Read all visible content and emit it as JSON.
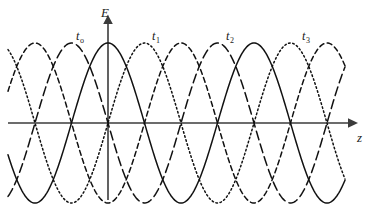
{
  "figure": {
    "axes": {
      "vertical": {
        "name": "E-axis",
        "label": "E",
        "arrow": "up-arrow-icon"
      },
      "horizontal": {
        "name": "z-axis",
        "label": "z",
        "arrow": "right-arrow-icon"
      }
    },
    "curve_labels": [
      {
        "id": "t0",
        "base": "t",
        "sub": "o",
        "line_style": "solid"
      },
      {
        "id": "t1",
        "base": "t",
        "sub": "1",
        "line_style": "dotted"
      },
      {
        "id": "t2",
        "base": "t",
        "sub": "2",
        "line_style": "dashed"
      },
      {
        "id": "t3",
        "base": "t",
        "sub": "3",
        "line_style": "long-dashed"
      }
    ]
  },
  "chart_data": {
    "type": "line",
    "title": "",
    "xlabel": "z",
    "ylabel": "E",
    "grid": false,
    "legend": "inline-curve-labels",
    "axis_origin_px": {
      "x": 108,
      "y": 123
    },
    "wavelength_px": 146,
    "amplitude_px": 80,
    "x_zero_crossings_px": [
      35,
      108,
      185,
      258,
      331
    ],
    "x_range_px": [
      8,
      345
    ],
    "stroke_color": "#111111",
    "axis_color": "#3b3b3b",
    "series": [
      {
        "name": "tₒ",
        "label": "t",
        "sublabel": "o",
        "style": "solid",
        "phase_shift_fraction_of_wavelength": 0.0,
        "description": "E = A cos(2π z / λ); crest on the E axis at z = 0",
        "label_position_px": {
          "x": 76,
          "y": 30
        }
      },
      {
        "name": "t₁",
        "label": "t",
        "sublabel": "1",
        "style": "dotted",
        "phase_shift_fraction_of_wavelength": 0.25,
        "description": "E = A cos(2π (z − λ/4) / λ); wave advanced a quarter wavelength in +z",
        "label_position_px": {
          "x": 152,
          "y": 30
        }
      },
      {
        "name": "t₂",
        "label": "t",
        "sublabel": "2",
        "style": "dashed",
        "phase_shift_fraction_of_wavelength": 0.5,
        "description": "E = A cos(2π (z − λ/2) / λ); trough on the E axis at z = 0",
        "label_position_px": {
          "x": 226,
          "y": 30
        }
      },
      {
        "name": "t₃",
        "label": "t",
        "sublabel": "3",
        "style": "long-dashed",
        "phase_shift_fraction_of_wavelength": 0.75,
        "description": "E = A cos(2π (z − 3λ/4) / λ); wave advanced three quarter wavelengths in +z",
        "label_position_px": {
          "x": 302,
          "y": 30
        }
      }
    ]
  }
}
